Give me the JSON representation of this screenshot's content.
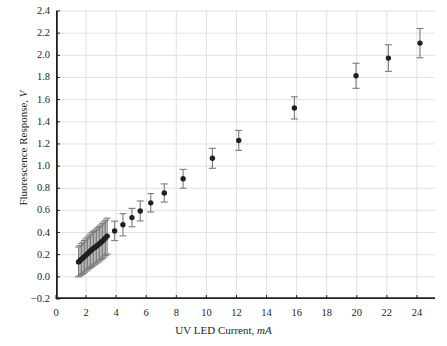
{
  "chart_data": {
    "type": "scatter",
    "title": "",
    "xlabel": "UV LED Current, mA",
    "xlabel_text": "UV LED Current, ",
    "xlabel_unit": "mA",
    "ylabel": "Fluorescence Response, V",
    "ylabel_text": "Fluorescence Response, ",
    "ylabel_unit": "V",
    "xlim": [
      0,
      25.2
    ],
    "ylim": [
      -0.2,
      2.4
    ],
    "xticks": [
      0,
      2,
      4,
      6,
      8,
      10,
      12,
      14,
      16,
      18,
      20,
      22,
      24
    ],
    "xtick_labels": [
      "0",
      "2",
      "4",
      "6",
      "8",
      "10",
      "12",
      "14",
      "16",
      "18",
      "20",
      "22",
      "24"
    ],
    "yticks": [
      -0.2,
      0.0,
      0.2,
      0.4,
      0.6,
      0.8,
      1.0,
      1.2,
      1.4,
      1.6,
      1.8,
      2.0,
      2.2,
      2.4
    ],
    "ytick_labels": [
      "−0.2",
      "0.0",
      "0.2",
      "0.4",
      "0.6",
      "0.8",
      "1.0",
      "1.2",
      "1.4",
      "1.6",
      "1.8",
      "2.0",
      "2.2",
      "2.4"
    ],
    "grid": true,
    "grid_color": "#d9d9d9",
    "legend": null,
    "marker": "filled-circle",
    "marker_color": "#231f20",
    "marker_size_px": 5.4,
    "errorbar_color": "#7a7a7a",
    "errorbar_direction": "vertical-symmetric",
    "errorbar_cap_width_px": 7,
    "series": [
      {
        "name": "Fluorescence response vs UV LED current",
        "x": [
          1.5,
          1.6,
          1.7,
          1.8,
          1.9,
          2.0,
          2.1,
          2.2,
          2.3,
          2.4,
          2.5,
          2.6,
          2.7,
          2.8,
          2.9,
          3.0,
          3.1,
          3.2,
          3.3,
          3.4,
          3.9,
          4.45,
          5.05,
          5.6,
          6.3,
          7.2,
          8.45,
          10.4,
          12.15,
          15.85,
          19.95,
          22.1,
          24.2
        ],
        "y": [
          0.135,
          0.147,
          0.16,
          0.172,
          0.185,
          0.197,
          0.21,
          0.222,
          0.235,
          0.247,
          0.258,
          0.268,
          0.278,
          0.289,
          0.3,
          0.312,
          0.325,
          0.338,
          0.352,
          0.368,
          0.415,
          0.47,
          0.535,
          0.595,
          0.668,
          0.757,
          0.885,
          1.07,
          1.232,
          1.525,
          1.815,
          1.975,
          2.11
        ],
        "yerr": [
          0.135,
          0.137,
          0.14,
          0.142,
          0.143,
          0.145,
          0.147,
          0.148,
          0.15,
          0.152,
          0.153,
          0.153,
          0.154,
          0.155,
          0.156,
          0.157,
          0.158,
          0.159,
          0.16,
          0.162,
          0.088,
          0.1,
          0.083,
          0.09,
          0.083,
          0.082,
          0.085,
          0.09,
          0.09,
          0.1,
          0.113,
          0.12,
          0.132
        ]
      }
    ]
  }
}
